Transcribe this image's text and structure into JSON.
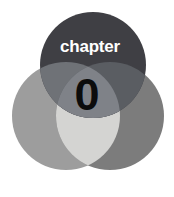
{
  "page": {
    "kind": "book-chapter-opener-graphic",
    "background_color": "#ffffff",
    "width": 174,
    "height": 197
  },
  "opener": {
    "chapter_word": "chapter",
    "chapter_number": "0"
  },
  "venn": {
    "top_circle": {
      "name": "top-circle",
      "color": "#3f3f44",
      "cx": 93,
      "cy": 65,
      "r": 53
    },
    "left_circle": {
      "name": "left-circle",
      "color": "#9d9d9d",
      "cx": 66,
      "cy": 116,
      "r": 54
    },
    "right_circle": {
      "name": "right-circle",
      "color": "#7c7c7c",
      "cx": 110,
      "cy": 116,
      "r": 54
    },
    "overlaps": {
      "left_right_center": "#d4d4d2",
      "top_left": "#6f7277",
      "top_right": "#5a5d62",
      "top_center": "#7f8288"
    }
  },
  "typography": {
    "chapter_word_color": "#ffffff",
    "chapter_number_color": "#0c0c0c"
  }
}
